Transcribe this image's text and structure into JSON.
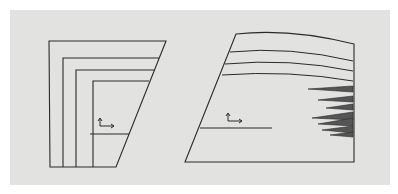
{
  "colors": {
    "background": "#ffffff",
    "panel": "#e2e2e0",
    "stroke": "#2a2a2a",
    "spike": "#555555"
  },
  "left_figure": {
    "name": "nested-trapezoid-layers",
    "outer": [
      [
        49,
        41
      ],
      [
        166,
        41
      ],
      [
        116,
        167
      ],
      [
        50,
        167
      ]
    ],
    "inner_layers": [
      {
        "x": 63,
        "top": 58,
        "right": 159
      },
      {
        "x": 76,
        "top": 70,
        "right": 154
      },
      {
        "x": 93,
        "top": 81,
        "right": 149
      }
    ],
    "bottom_y": 167,
    "section_line": [
      [
        90,
        134
      ],
      [
        129,
        134
      ]
    ],
    "axes_origin": [
      100,
      126
    ]
  },
  "right_figure": {
    "name": "curved-trapezoid-with-spikes",
    "outline": "M236,34 Q290,28 354,44 L354,162 L185,162 Z",
    "layer_curves": [
      "M230,52 Q290,46 353,61",
      "M225,64 Q290,58 353,71",
      "M222,75 Q290,70 353,81"
    ],
    "section_line": [
      [
        200,
        128
      ],
      [
        272,
        128
      ]
    ],
    "axes_origin": [
      228,
      121
    ],
    "spikes": [
      [
        [
          308,
          89
        ],
        [
          353,
          86
        ],
        [
          353,
          92
        ]
      ],
      [
        [
          318,
          100
        ],
        [
          353,
          96
        ],
        [
          353,
          102
        ]
      ],
      [
        [
          326,
          108
        ],
        [
          353,
          104
        ],
        [
          353,
          110
        ]
      ],
      [
        [
          312,
          118
        ],
        [
          353,
          112
        ],
        [
          353,
          120
        ]
      ],
      [
        [
          318,
          124
        ],
        [
          353,
          118
        ],
        [
          353,
          126
        ]
      ],
      [
        [
          322,
          130
        ],
        [
          353,
          126
        ],
        [
          353,
          133
        ]
      ],
      [
        [
          330,
          135
        ],
        [
          353,
          132
        ],
        [
          353,
          137
        ]
      ]
    ]
  }
}
